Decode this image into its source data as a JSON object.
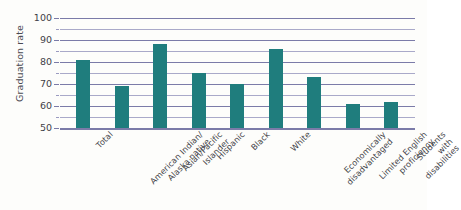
{
  "chart_data": {
    "type": "bar",
    "title": "",
    "xlabel": "",
    "ylabel": "Graduation rate",
    "ylim": [
      50,
      100
    ],
    "ytick_labels": [
      "100",
      "90",
      "80",
      "70",
      "60",
      "50"
    ],
    "ytick_values": [
      100,
      90,
      80,
      70,
      60,
      50
    ],
    "minor_gridline_values": [
      95,
      85,
      75,
      65,
      55
    ],
    "grid": true,
    "legend": "none",
    "bar_color": "#1f7d7d",
    "gridline_color": "#7b7ba8",
    "categories": [
      "Total",
      "American Indian/\nAlaska native",
      "Asian/Pacific\nIslander",
      "Hispanic",
      "Black",
      "White",
      "Economically\ndisadvantaged",
      "Limited English\nproficiency",
      "Students with\ndisabilities"
    ],
    "values": [
      81,
      69,
      88,
      75,
      70,
      86,
      73,
      61,
      62
    ]
  }
}
